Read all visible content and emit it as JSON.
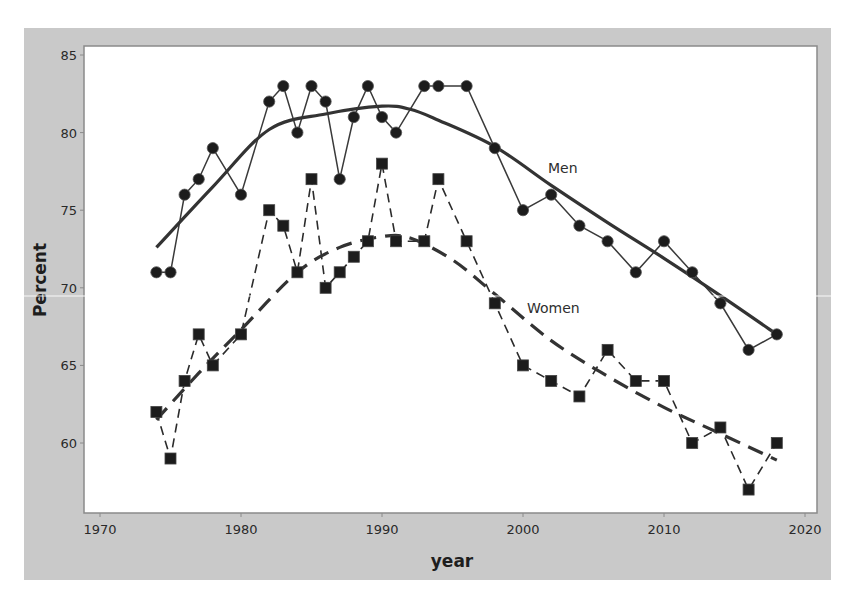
{
  "chart_data": {
    "type": "line",
    "title": "",
    "xlabel": "year",
    "ylabel": "Percent",
    "xlim": [
      1969,
      2021
    ],
    "ylim": [
      55.5,
      85.5
    ],
    "x_ticks": [
      1970,
      1980,
      1990,
      2000,
      2010,
      2020
    ],
    "y_ticks": [
      60,
      65,
      70,
      75,
      80,
      85
    ],
    "grid": false,
    "legend": "none (inline labels)",
    "annotations": [
      {
        "text": "Men",
        "x": 2004.5,
        "y": 77.3
      },
      {
        "text": "Women",
        "x": 2006,
        "y": 68.4
      }
    ],
    "series": [
      {
        "name": "Men",
        "style": "solid line with circle markers",
        "x": [
          1974,
          1975,
          1976,
          1977,
          1978,
          1980,
          1982,
          1983,
          1984,
          1985,
          1986,
          1987,
          1988,
          1989,
          1990,
          1991,
          1993,
          1994,
          1996,
          1998,
          2000,
          2002,
          2004,
          2006,
          2008,
          2010,
          2012,
          2014,
          2016,
          2018
        ],
        "values": [
          71,
          71,
          76,
          77,
          79,
          76,
          82,
          83,
          80,
          83,
          82,
          77,
          81,
          83,
          81,
          80,
          83,
          83,
          83,
          79,
          75,
          76,
          74,
          73,
          71,
          73,
          71,
          69,
          66,
          67
        ]
      },
      {
        "name": "Women",
        "style": "dashed line with square markers",
        "x": [
          1974,
          1975,
          1976,
          1977,
          1978,
          1980,
          1982,
          1983,
          1984,
          1985,
          1986,
          1987,
          1988,
          1989,
          1990,
          1991,
          1993,
          1994,
          1996,
          1998,
          2000,
          2002,
          2004,
          2006,
          2008,
          2010,
          2012,
          2014,
          2016,
          2018
        ],
        "values": [
          62,
          59,
          64,
          67,
          65,
          67,
          75,
          74,
          71,
          77,
          70,
          71,
          72,
          73,
          78,
          73,
          73,
          77,
          73,
          69,
          65,
          64,
          63,
          66,
          64,
          64,
          60,
          61,
          57,
          60
        ]
      },
      {
        "name": "Men (smoothed trend)",
        "style": "thick solid line",
        "x": [
          1974,
          1978,
          1982,
          1986,
          1990,
          1992,
          1994,
          1998,
          2002,
          2006,
          2010,
          2014,
          2018
        ],
        "values": [
          72.6,
          76.5,
          80.2,
          81.2,
          81.7,
          81.5,
          80.8,
          79.1,
          76.6,
          74.2,
          71.9,
          69.5,
          67.0
        ]
      },
      {
        "name": "Women (smoothed trend)",
        "style": "thick dashed line",
        "x": [
          1974,
          1977,
          1980,
          1984,
          1987,
          1990,
          1992,
          1995,
          1998,
          2002,
          2006,
          2010,
          2014,
          2018
        ],
        "values": [
          61.5,
          64.5,
          67.3,
          71.0,
          72.6,
          73.3,
          73.2,
          71.8,
          69.6,
          66.6,
          64.3,
          62.3,
          60.6,
          58.9
        ]
      }
    ]
  },
  "colors": {
    "frame_background": "#c9c9c9",
    "plot_background": "#ffffff",
    "plot_border": "#8a8a8a",
    "series_color": "#2b2b2b",
    "trend_color": "#333333",
    "marker_color": "#1c1c1c"
  },
  "labels": {
    "xlabel": "year",
    "ylabel": "Percent",
    "men": "Men",
    "women": "Women"
  }
}
